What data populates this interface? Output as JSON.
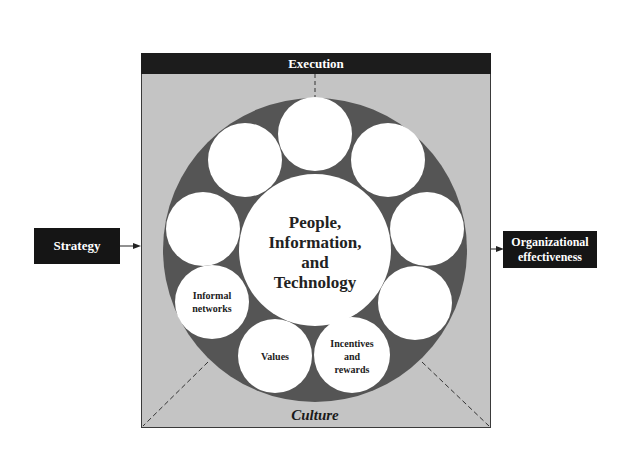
{
  "diagram": {
    "top_bar": {
      "label": "Execution"
    },
    "bottom_label": "Culture",
    "input": {
      "label": "Strategy"
    },
    "output": {
      "label": "Organizational effectiveness",
      "line1": "Organizational",
      "line2": "effectiveness"
    },
    "center": {
      "label": "People, Information, and Technology",
      "line1": "People,",
      "line2": "Information,",
      "line3": "and",
      "line4": "Technology"
    },
    "orbit_circles": [
      {
        "position": "top",
        "label": ""
      },
      {
        "position": "top-right",
        "label": ""
      },
      {
        "position": "right",
        "label": ""
      },
      {
        "position": "lower-right",
        "label": ""
      },
      {
        "position": "bottom-right",
        "label": "Incentives and rewards",
        "line1": "Incentives",
        "line2": "and",
        "line3": "rewards"
      },
      {
        "position": "bottom-left",
        "label": "Values",
        "line1": "Values"
      },
      {
        "position": "lower-left",
        "label": "Informal networks",
        "line1": "Informal",
        "line2": "networks"
      },
      {
        "position": "left",
        "label": ""
      },
      {
        "position": "top-left",
        "label": ""
      }
    ],
    "colors": {
      "frame_fill": "#c4c4c4",
      "ring_fill": "#555555",
      "circle_fill": "#ffffff",
      "dark_box": "#151515"
    }
  }
}
